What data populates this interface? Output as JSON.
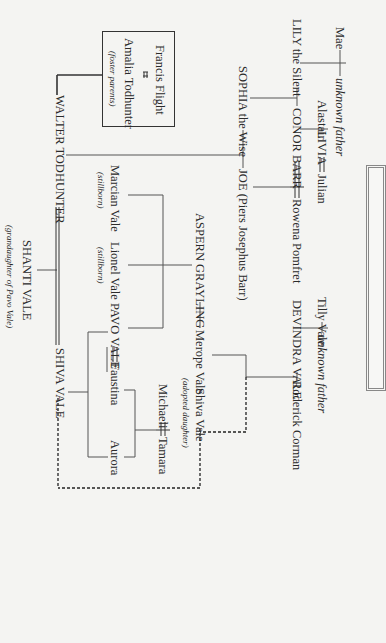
{
  "diagram": {
    "type": "family-tree",
    "orientation": "rotated-90-clockwise",
    "people": {
      "mae": "Mae",
      "unknown_father_1": "unknown father",
      "lily": "LILY the Silent",
      "alastair": "Alastair",
      "livia": "LIVIA",
      "julian": "Julian",
      "conor": "CONOR BARR",
      "rowena": "Rowena Pomfret",
      "sophia": "SOPHIA the Wise",
      "joe": "JOE (Piers Josephus Barr)",
      "francis": "Francis Flight",
      "amalia": "Amalia Todhunter",
      "foster_note": "(foster parents)",
      "walter": "WALTER TODHUNTER",
      "marcian": "Marcian Vale",
      "marcian_note": "(stillborn)",
      "lionel": "Lionel Vale",
      "lionel_note": "(stillborn)",
      "pavo": "PAVO VALE",
      "faustina": "Faustina",
      "aurora": "Aurora",
      "aspern": "ASPERN GRAYLING",
      "merope": "Merope Vale",
      "tilly": "Tilly Vale",
      "unknown_father_2": "unknown father",
      "devindra": "DEVINDRA VALE",
      "roderick": "Roderick Corman",
      "shiva_adopted": "Shiva Vale",
      "shiva_adopted_note": "(adopted daughter)",
      "michaeli": "Michaeli",
      "tamara": "Tamara",
      "shanti": "SHANTI VALE",
      "shanti_note": "(grandaughter of Pavo Vale)",
      "shiva": "SHIVA VALE"
    },
    "relationships": [
      {
        "type": "union",
        "a": "Mae",
        "b": "unknown father",
        "children": [
          "LILY the Silent"
        ]
      },
      {
        "type": "union",
        "a": "Alastair",
        "b": "LIVIA",
        "children": [
          "CONOR BARR"
        ]
      },
      {
        "type": "marriage",
        "a": "LIVIA",
        "b": "Julian"
      },
      {
        "type": "union",
        "a": "LILY the Silent",
        "b": "CONOR BARR",
        "children": [
          "SOPHIA the Wise"
        ]
      },
      {
        "type": "marriage",
        "a": "CONOR BARR",
        "b": "Rowena Pomfret",
        "children": [
          "JOE (Piers Josephus Barr)"
        ]
      },
      {
        "type": "union",
        "a": "SOPHIA the Wise",
        "b": "JOE (Piers Josephus Barr)",
        "children": [
          "WALTER TODHUNTER"
        ]
      },
      {
        "type": "marriage",
        "a": "Francis Flight",
        "b": "Amalia Todhunter",
        "note": "foster parents of WALTER TODHUNTER"
      },
      {
        "type": "union",
        "a": "ASPERN GRAYLING",
        "b": "Merope Vale",
        "children": [
          "Marcian Vale",
          "Lionel Vale",
          "PAVO VALE"
        ]
      },
      {
        "type": "union",
        "a": "Tilly Vale",
        "b": "unknown father",
        "children": [
          "DEVINDRA VALE"
        ]
      },
      {
        "type": "union",
        "a": "DEVINDRA VALE",
        "b": "Roderick Corman",
        "children": [
          "Merope Vale"
        ],
        "adopted": [
          "Shiva Vale"
        ]
      },
      {
        "type": "marriage",
        "a": "PAVO VALE",
        "b": "Faustina",
        "children": [
          "SHIVA VALE",
          "Aurora"
        ]
      },
      {
        "type": "marriage",
        "a": "Michaeli",
        "b": "Tamara",
        "children": [
          "Faustina",
          "Aurora"
        ]
      },
      {
        "type": "marriage",
        "a": "WALTER TODHUNTER",
        "b": "SHIVA VALE",
        "children": [
          "SHANTI VALE"
        ]
      },
      {
        "type": "identity-link",
        "a": "Shiva Vale",
        "b": "SHIVA VALE",
        "style": "dashed"
      }
    ]
  }
}
